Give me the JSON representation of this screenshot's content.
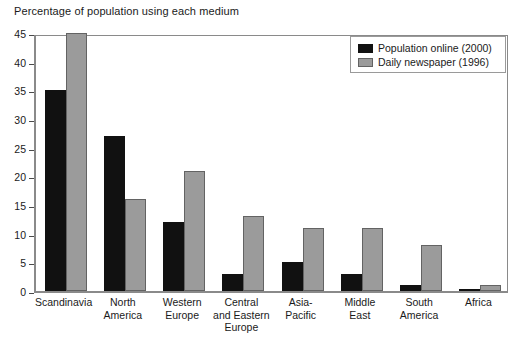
{
  "chart_data": {
    "type": "bar",
    "title": "Percentage of population using each medium",
    "xlabel": "",
    "ylabel": "",
    "ylim": [
      0,
      45
    ],
    "ytick_step": 5,
    "yticks": [
      0,
      5,
      10,
      15,
      20,
      25,
      30,
      35,
      40,
      45
    ],
    "ytick_labels": [
      "0",
      "5",
      "10",
      "15",
      "20",
      "25",
      "30",
      "35",
      "40",
      "45"
    ],
    "grid": false,
    "legend_position": "top-right",
    "categories": [
      "Scandinavia",
      "North America",
      "Western Europe",
      "Central and Eastern Europe",
      "Asia-Pacific",
      "Middle East",
      "South America",
      "Africa"
    ],
    "category_label_lines": [
      [
        "Scandinavia"
      ],
      [
        "North",
        "America"
      ],
      [
        "Western",
        "Europe"
      ],
      [
        "Central",
        "and Eastern",
        "Europe"
      ],
      [
        "Asia-",
        "Pacific"
      ],
      [
        "Middle",
        "East"
      ],
      [
        "South",
        "America"
      ],
      [
        "Africa"
      ]
    ],
    "series": [
      {
        "name": "Population online (2000)",
        "color": "#111111",
        "values": [
          35,
          27,
          12,
          3,
          5,
          3,
          1,
          0.3
        ]
      },
      {
        "name": "Daily newspaper (1996)",
        "color": "#9b9b9b",
        "values": [
          45,
          16,
          21,
          13,
          11,
          11,
          8,
          1
        ]
      }
    ]
  },
  "legend": {
    "entries": [
      {
        "label": "Population online (2000)"
      },
      {
        "label": "Daily newspaper (1996)"
      }
    ]
  }
}
